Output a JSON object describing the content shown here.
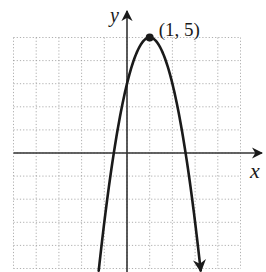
{
  "chart_data": {
    "type": "line",
    "title": "",
    "xlabel": "x",
    "ylabel": "y",
    "xlim": [
      -5,
      5
    ],
    "ylim": [
      -5,
      5
    ],
    "grid": true,
    "grid_style": "dotted",
    "tick_labels": false,
    "series": [
      {
        "name": "parabola",
        "equation": "y = -2(x - 1)^2 + 5",
        "vertex": [
          1,
          5
        ],
        "x_intercepts": [
          -0.58,
          2.58
        ],
        "y_intercept": 3,
        "x": [
          -1.25,
          -1,
          -0.5,
          0,
          0.5,
          1,
          1.5,
          2,
          2.5,
          3,
          3.25
        ],
        "y": [
          -5.13,
          -3,
          -0.5,
          3,
          4.5,
          5,
          4.5,
          3,
          0.5,
          -3,
          -5.13
        ],
        "arrows_at_ends": true
      }
    ],
    "annotations": [
      {
        "text": "(1, 5)",
        "point": [
          1,
          5
        ],
        "marker": "filled-dot"
      }
    ]
  },
  "labels": {
    "x_axis": "x",
    "y_axis": "y",
    "vertex": "(1, 5)"
  }
}
